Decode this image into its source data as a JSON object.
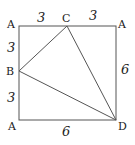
{
  "diagram": {
    "type": "geometry",
    "shape": "square with inscribed triangle BCD",
    "points": {
      "A_top_left": {
        "label": "A",
        "x": 19,
        "y": 26
      },
      "A_top_right": {
        "label": "A",
        "x": 116,
        "y": 26
      },
      "A_bottom_left": {
        "label": "A",
        "x": 19,
        "y": 120
      },
      "D": {
        "label": "D",
        "x": 116,
        "y": 120
      },
      "C": {
        "label": "C",
        "x": 67,
        "y": 26
      },
      "B": {
        "label": "B",
        "x": 19,
        "y": 71
      }
    },
    "lengths": {
      "top_left_segment": "3",
      "top_right_segment": "3",
      "left_upper_segment": "3",
      "left_lower_segment": "3",
      "right_side": "6",
      "bottom_side": "6"
    },
    "line_color": "#555555"
  }
}
